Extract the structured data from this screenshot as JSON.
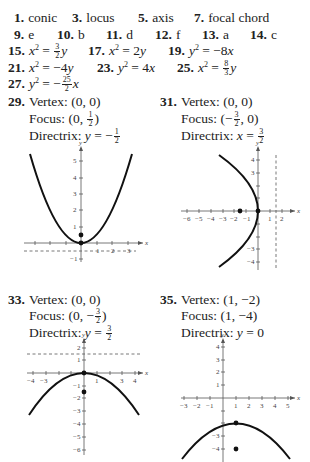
{
  "vocab": [
    {
      "num": "1.",
      "answer": "conic"
    },
    {
      "num": "3.",
      "answer": "locus"
    },
    {
      "num": "5.",
      "answer": "axis"
    },
    {
      "num": "7.",
      "answer": "focal chord"
    }
  ],
  "matching": [
    {
      "num": "9.",
      "answer": "e"
    },
    {
      "num": "10.",
      "answer": "b"
    },
    {
      "num": "11.",
      "answer": "d"
    },
    {
      "num": "12.",
      "answer": "f"
    },
    {
      "num": "13.",
      "answer": "a"
    },
    {
      "num": "14.",
      "answer": "c"
    }
  ],
  "equations": [
    {
      "num": "15.",
      "lhs": "x",
      "rel": " = ",
      "frac_n": "3",
      "frac_d": "2",
      "rhs": "y",
      "sign": ""
    },
    {
      "num": "17.",
      "lhs": "x",
      "rel": " = 2",
      "rhs": "y"
    },
    {
      "num": "19.",
      "lhs": "y",
      "rel": " = −8",
      "rhs": "x"
    },
    {
      "num": "21.",
      "lhs": "x",
      "rel": " = −4",
      "rhs": "y"
    },
    {
      "num": "23.",
      "lhs": "y",
      "rel": " = 4",
      "rhs": "x"
    },
    {
      "num": "25.",
      "lhs": "x",
      "rel": " = ",
      "frac_n": "8",
      "frac_d": "3",
      "rhs": "y"
    },
    {
      "num": "27.",
      "lhs": "y",
      "rel": " = −",
      "frac_n": "25",
      "frac_d": "2",
      "rhs": "x"
    }
  ],
  "exp": "2",
  "problems": [
    {
      "num": "29.",
      "vertex_label": "Vertex:",
      "vertex": "(0, 0)",
      "focus_label": "Focus:",
      "focus_pre": "(0, ",
      "focus_frac_n": "1",
      "focus_frac_d": "2",
      "focus_post": ")",
      "directrix_label": "Directrix:",
      "directrix_var": "y",
      "directrix_rel": " = −",
      "directrix_frac_n": "1",
      "directrix_frac_d": "2"
    },
    {
      "num": "31.",
      "vertex_label": "Vertex:",
      "vertex": "(0, 0)",
      "focus_label": "Focus:",
      "focus_pre": "(−",
      "focus_frac_n": "3",
      "focus_frac_d": "2",
      "focus_post": ", 0)",
      "directrix_label": "Directrix:",
      "directrix_var": "x",
      "directrix_rel": " = ",
      "directrix_frac_n": "3",
      "directrix_frac_d": "2"
    },
    {
      "num": "33.",
      "vertex_label": "Vertex:",
      "vertex": "(0, 0)",
      "focus_label": "Focus:",
      "focus_pre": "(0, −",
      "focus_frac_n": "3",
      "focus_frac_d": "2",
      "focus_post": ")",
      "directrix_label": "Directrix:",
      "directrix_var": "y",
      "directrix_rel": " = ",
      "directrix_frac_n": "3",
      "directrix_frac_d": "2"
    },
    {
      "num": "35.",
      "vertex_label": "Vertex:",
      "vertex": "(1, −2)",
      "focus_label": "Focus:",
      "focus_text": "(1, −4)",
      "directrix_label": "Directrix:",
      "directrix_var": "y",
      "directrix_rel": " = 0"
    }
  ],
  "graphs": {
    "axis_x_label": "x",
    "axis_y_label": "y",
    "g29": {
      "xticks": [
        "1",
        "2",
        "3"
      ],
      "yticks": [
        "5",
        "4",
        "3",
        "2",
        "1",
        "−1"
      ]
    },
    "g31": {
      "xticks": [
        "−6",
        "−5",
        "−4",
        "−3",
        "−2",
        "−1",
        "1",
        "2"
      ],
      "yticks": [
        "4",
        "3",
        "−3",
        "−4"
      ]
    },
    "g33": {
      "xticks": [
        "−4",
        "−3",
        "1",
        "3",
        "4"
      ],
      "yticks": [
        "2",
        "1",
        "−1",
        "−2",
        "−3",
        "−4",
        "−5",
        "−6"
      ]
    },
    "g35": {
      "xticks": [
        "−3",
        "−2",
        "−1",
        "1",
        "2",
        "3",
        "4",
        "5"
      ],
      "yticks": [
        "4",
        "3",
        "2",
        "1",
        "−3",
        "−4"
      ]
    }
  }
}
